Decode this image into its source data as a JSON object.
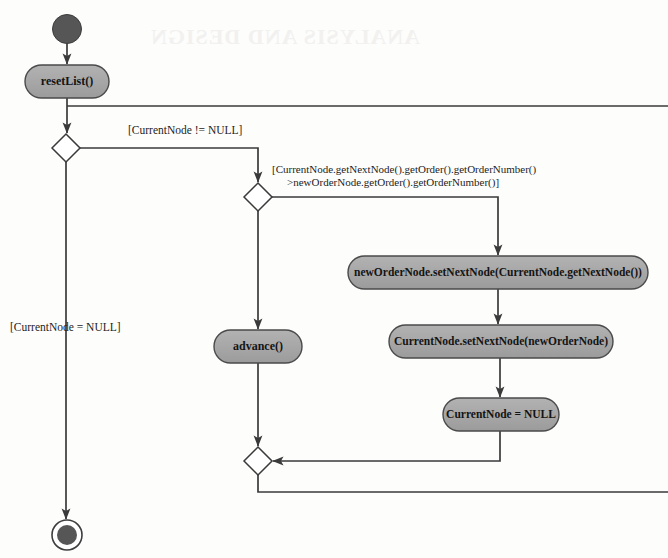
{
  "diagram": {
    "type": "uml-activity-diagram",
    "background_color": "#fdfdfc",
    "node_fill_color": "#a8a8a8",
    "node_stroke_color": "#4a4a4a",
    "line_color": "#3a3a3a",
    "text_color": "#141414",
    "initial_node": {
      "name": "initial-node",
      "shape": "filled-circle",
      "cx": 67,
      "cy": 29,
      "r": 14.5,
      "fill": "#565656"
    },
    "final_node": {
      "name": "final-node",
      "shape": "bullseye",
      "cx": 67,
      "cy": 535,
      "outer_r": 15,
      "inner_r": 10,
      "fill": "#565656"
    },
    "actions": [
      {
        "id": "reset-list",
        "label": "resetList()",
        "x": 25,
        "y": 65,
        "w": 84,
        "h": 33,
        "font_size": 12
      },
      {
        "id": "advance",
        "label": "advance()",
        "x": 214,
        "y": 330,
        "w": 88,
        "h": 33,
        "font_size": 12
      },
      {
        "id": "new-order-node-set-next-node",
        "label": "newOrderNode.setNextNode(CurrentNode.getNextNode())",
        "x": 348,
        "y": 256,
        "w": 300,
        "h": 33,
        "font_size": 11.5
      },
      {
        "id": "current-node-set-next-node",
        "label": "CurrentNode.setNextNode(newOrderNode)",
        "x": 389,
        "y": 325,
        "w": 224,
        "h": 33,
        "font_size": 11.5
      },
      {
        "id": "current-node-null-assign",
        "label": "CurrentNode = NULL",
        "x": 443,
        "y": 398,
        "w": 116,
        "h": 33,
        "font_size": 11.5
      }
    ],
    "decisions": [
      {
        "id": "decision-current-node-null",
        "cx": 66,
        "cy": 148,
        "half": 14
      },
      {
        "id": "decision-order-number-compare",
        "cx": 258,
        "cy": 197,
        "half": 14
      }
    ],
    "merges": [
      {
        "id": "merge-loop-back",
        "cx": 258,
        "cy": 461,
        "half": 14
      }
    ],
    "guards": [
      {
        "id": "guard-current-node-not-null",
        "lines": [
          "[CurrentNode != NULL]"
        ],
        "x": 128,
        "y": 131,
        "anchor": "start",
        "font_size": 11.5
      },
      {
        "id": "guard-order-number-greater",
        "lines": [
          "[CurrentNode.getNextNode().getOrder().getOrderNumber()",
          ">newOrderNode.getOrder().getOrderNumber()]"
        ],
        "x": 272,
        "y": 170,
        "anchor": "start",
        "font_size": 11,
        "line_height": 13
      },
      {
        "id": "guard-current-node-null",
        "lines": [
          "[CurrentNode = NULL]"
        ],
        "x": 10,
        "y": 328,
        "anchor": "start",
        "font_size": 11.5
      }
    ],
    "flows": [
      {
        "id": "flow-initial-to-reset",
        "points": "67,43.5 67,65",
        "arrow": true
      },
      {
        "id": "flow-reset-to-decision1",
        "points": "67,98 67,134",
        "arrow": true
      },
      {
        "id": "flow-decision1-true-to-decision2",
        "points": "80,148 258,148 258,183",
        "arrow": true
      },
      {
        "id": "flow-decision1-false-to-final",
        "points": "66,162 66,520",
        "arrow": true
      },
      {
        "id": "flow-decision2-false-to-advance",
        "points": "258,211 258,330",
        "arrow": true
      },
      {
        "id": "flow-decision2-true-to-action1",
        "points": "272,197 498,197 498,256",
        "arrow": true
      },
      {
        "id": "flow-action1-to-action2",
        "points": "498,289 498,325",
        "arrow": true
      },
      {
        "id": "flow-action2-to-action3",
        "points": "500,358 500,398",
        "arrow": true
      },
      {
        "id": "flow-action3-to-merge",
        "points": "500,431 500,461 272,461",
        "arrow": true
      },
      {
        "id": "flow-advance-to-merge",
        "points": "258,363 258,447",
        "arrow": true
      },
      {
        "id": "flow-merge-to-loopback",
        "points": "258,475 258,492 668,492",
        "arrow": false
      },
      {
        "id": "flow-loopback-to-decision1-top",
        "points": "668,106 67,106",
        "arrow": false
      }
    ],
    "watermark": {
      "text": "ANALYSIS AND DESIGN",
      "visible_faint": true
    }
  }
}
